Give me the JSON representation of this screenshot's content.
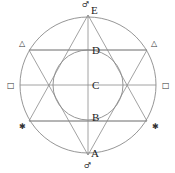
{
  "diagram": {
    "points": [
      {
        "id": "E",
        "label": "E"
      },
      {
        "id": "D",
        "label": "D"
      },
      {
        "id": "C",
        "label": "C"
      },
      {
        "id": "B",
        "label": "B"
      },
      {
        "id": "A",
        "label": "A"
      }
    ],
    "symbols": {
      "top": "♂",
      "bottom": "♂",
      "upper_left": "△",
      "upper_right": "△",
      "mid_left": "□",
      "mid_right": "□",
      "lower_left": "✱",
      "lower_right": "✱"
    },
    "colors": {
      "stroke": "#8a8a8a",
      "text": "#222222"
    }
  }
}
